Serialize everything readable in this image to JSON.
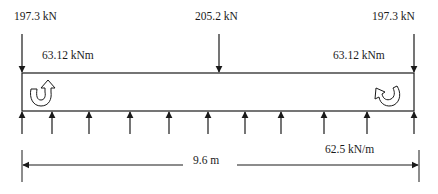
{
  "diagram": {
    "colors": {
      "line": "#1a1a1a",
      "background": "#ffffff"
    },
    "beam": {
      "left_x": 22,
      "right_x": 414,
      "top_y": 73,
      "bottom_y": 111
    },
    "point_loads": [
      {
        "label": "197.3 kN",
        "position": "left",
        "x": 22
      },
      {
        "label": "205.2 kN",
        "position": "middle",
        "x": 219
      },
      {
        "label": "197.3 kN",
        "position": "right",
        "x": 414
      }
    ],
    "moments": [
      {
        "label": "63.12 kNm",
        "position": "left",
        "direction": "counterclockwise"
      },
      {
        "label": "63.12 kNm",
        "position": "right",
        "direction": "clockwise"
      }
    ],
    "distributed_load": {
      "label": "62.5 kN/m",
      "direction": "up",
      "arrow_x": [
        22,
        52,
        89,
        130,
        169,
        208,
        245,
        281,
        324,
        367,
        414
      ]
    },
    "dimension": {
      "label": "9.6 m"
    }
  }
}
